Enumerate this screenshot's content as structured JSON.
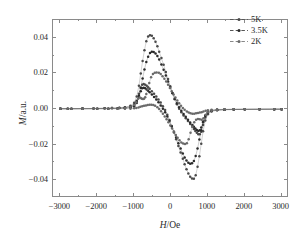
{
  "figure": {
    "background_color": "#ffffff",
    "frame_color": "#8a8a8a",
    "axis_title_x": "H/Oe",
    "axis_title_x_italic_part": "H",
    "axis_title_x_rest": "/Oe",
    "axis_title_y": "M/a.u.",
    "axis_title_y_italic_part": "M",
    "axis_title_y_rest": "/a.u."
  },
  "legend": {
    "position": "top-right",
    "entries": [
      {
        "label": "5K",
        "color": "#4a4a4a",
        "marker": "dot"
      },
      {
        "label": "3.5K",
        "color": "#2a2a2a",
        "marker": "dot"
      },
      {
        "label": "2K",
        "color": "#6a6a6a",
        "marker": "dot"
      }
    ]
  },
  "axes": {
    "x_ticks": [
      -3000,
      -2000,
      -1000,
      0,
      1000,
      2000,
      3000
    ],
    "x_tick_labels": [
      "-3000",
      "-2000",
      "-1000",
      "0",
      "1000",
      "2000",
      "3000"
    ],
    "y_ticks": [
      0.04,
      0.02,
      0.0,
      -0.02,
      -0.04
    ],
    "y_tick_labels": [
      "0.04",
      "0.02",
      "0.00",
      "-0.02",
      "-0.04"
    ],
    "xlim": [
      -3200,
      3200
    ],
    "ylim": [
      -0.05,
      0.05
    ],
    "x_minor_per_major": 2,
    "y_minor_per_major": 2
  },
  "chart_data": {
    "type": "line",
    "title": "",
    "xlabel": "H/Oe",
    "ylabel": "M/a.u.",
    "xlim": [
      -3200,
      3200
    ],
    "ylim": [
      -0.05,
      0.05
    ],
    "grid": false,
    "legend_position": "top-right",
    "series": [
      {
        "name": "5K",
        "color": "#4a4a4a",
        "marker": "dot",
        "linestyle": "dashdot",
        "peak_positive": 0.0415,
        "peak_positive_at_H": -520,
        "peak_negative": -0.0392,
        "peak_negative_at_H": 620,
        "branch_descending_x": [
          -3000,
          -2700,
          -2400,
          -2100,
          -1800,
          -1600,
          -1400,
          -1250,
          -1100,
          -1000,
          -930,
          -870,
          -820,
          -770,
          -720,
          -670,
          -620,
          -570,
          -520,
          -470,
          -420,
          -370,
          -320,
          -260,
          -200,
          -140,
          -80,
          -20,
          40,
          100,
          160,
          220,
          280,
          340,
          400,
          460,
          520,
          580,
          620,
          660,
          700,
          740,
          780,
          820,
          870,
          930,
          1000,
          1100,
          1250,
          1450,
          1700,
          2000,
          2400,
          2800,
          3000
        ],
        "branch_descending_y": [
          0.0002,
          0.0002,
          0.0003,
          0.0003,
          0.0004,
          0.0005,
          0.0007,
          0.001,
          0.0018,
          0.0035,
          0.007,
          0.013,
          0.02,
          0.027,
          0.033,
          0.038,
          0.0408,
          0.0415,
          0.0412,
          0.0398,
          0.0378,
          0.0352,
          0.0322,
          0.0286,
          0.0248,
          0.0208,
          0.0168,
          0.0128,
          0.009,
          0.0055,
          0.0026,
          0.0002,
          -0.0018,
          -0.0036,
          -0.0052,
          -0.0068,
          -0.0084,
          -0.01,
          -0.0112,
          -0.0124,
          -0.0134,
          -0.0142,
          -0.0142,
          -0.0128,
          -0.009,
          -0.0048,
          -0.0022,
          -0.001,
          -0.0005,
          -0.0003,
          -0.0002,
          -0.0002,
          -0.0001,
          -0.0001,
          -0.0001
        ],
        "branch_ascending_x": [
          3000,
          2800,
          2400,
          2000,
          1700,
          1450,
          1250,
          1100,
          1000,
          930,
          870,
          820,
          770,
          720,
          670,
          620,
          570,
          520,
          470,
          420,
          370,
          320,
          260,
          200,
          140,
          80,
          20,
          -40,
          -100,
          -160,
          -220,
          -280,
          -340,
          -400,
          -460,
          -520,
          -580,
          -620,
          -660,
          -700,
          -740,
          -780,
          -820,
          -870,
          -930,
          -1000,
          -1100,
          -1250,
          -1450,
          -1700,
          -2000,
          -2400,
          -2800,
          -3000
        ],
        "branch_ascending_y": [
          -0.0001,
          -0.0001,
          -0.0002,
          -0.0002,
          -0.0003,
          -0.0004,
          -0.0007,
          -0.0014,
          -0.003,
          -0.0065,
          -0.0125,
          -0.0195,
          -0.0265,
          -0.0325,
          -0.0372,
          -0.0392,
          -0.039,
          -0.038,
          -0.0362,
          -0.0338,
          -0.031,
          -0.028,
          -0.0244,
          -0.0208,
          -0.017,
          -0.0132,
          -0.0096,
          -0.0062,
          -0.0032,
          -0.0006,
          0.0016,
          0.0036,
          0.0054,
          0.007,
          0.0086,
          0.01,
          0.0114,
          0.0122,
          0.013,
          0.0136,
          0.014,
          0.0136,
          0.012,
          0.0086,
          0.0046,
          0.0022,
          0.001,
          0.0005,
          0.0003,
          0.0002,
          0.0002,
          0.0001,
          0.0001,
          0.0001
        ]
      },
      {
        "name": "3.5K",
        "color": "#2a2a2a",
        "marker": "dot",
        "linestyle": "dashdot",
        "peak_positive": 0.0322,
        "peak_positive_at_H": -420,
        "peak_negative": -0.0307,
        "peak_negative_at_H": 520,
        "branch_descending_x": [
          -3000,
          -2700,
          -2400,
          -2100,
          -1800,
          -1600,
          -1400,
          -1250,
          -1100,
          -1000,
          -930,
          -870,
          -820,
          -770,
          -720,
          -670,
          -620,
          -570,
          -520,
          -470,
          -420,
          -370,
          -320,
          -260,
          -200,
          -140,
          -80,
          -20,
          40,
          100,
          160,
          220,
          280,
          340,
          400,
          460,
          520,
          580,
          620,
          660,
          700,
          740,
          780,
          820,
          870,
          930,
          1000,
          1100,
          1250,
          1450,
          1700,
          2000,
          2400,
          2800,
          3000
        ],
        "branch_descending_y": [
          0.0002,
          0.0002,
          0.0003,
          0.0003,
          0.0004,
          0.0005,
          0.0006,
          0.0009,
          0.0014,
          0.0024,
          0.0042,
          0.0075,
          0.012,
          0.0172,
          0.0222,
          0.0264,
          0.0294,
          0.0314,
          0.0322,
          0.032,
          0.0312,
          0.0298,
          0.0278,
          0.025,
          0.022,
          0.0188,
          0.0154,
          0.012,
          0.0088,
          0.0058,
          0.0032,
          0.001,
          -0.001,
          -0.0028,
          -0.0044,
          -0.006,
          -0.0076,
          -0.009,
          -0.01,
          -0.011,
          -0.0118,
          -0.0124,
          -0.012,
          -0.0104,
          -0.007,
          -0.0036,
          -0.0016,
          -0.0008,
          -0.0004,
          -0.0003,
          -0.0002,
          -0.0002,
          -0.0001,
          -0.0001,
          -0.0001
        ],
        "branch_ascending_x": [
          3000,
          2800,
          2400,
          2000,
          1700,
          1450,
          1250,
          1100,
          1000,
          930,
          870,
          820,
          770,
          720,
          670,
          620,
          570,
          520,
          470,
          420,
          370,
          320,
          260,
          200,
          140,
          80,
          20,
          -40,
          -100,
          -160,
          -220,
          -280,
          -340,
          -400,
          -460,
          -520,
          -580,
          -620,
          -660,
          -700,
          -740,
          -780,
          -820,
          -870,
          -930,
          -1000,
          -1100,
          -1250,
          -1450,
          -1700,
          -2000,
          -2400,
          -2800,
          -3000
        ],
        "branch_ascending_y": [
          -0.0001,
          -0.0001,
          -0.0002,
          -0.0002,
          -0.0003,
          -0.0004,
          -0.0006,
          -0.0011,
          -0.0022,
          -0.004,
          -0.0074,
          -0.012,
          -0.0172,
          -0.0222,
          -0.0264,
          -0.0292,
          -0.0305,
          -0.0307,
          -0.0302,
          -0.029,
          -0.0272,
          -0.025,
          -0.0222,
          -0.0192,
          -0.016,
          -0.0128,
          -0.0098,
          -0.0068,
          -0.0042,
          -0.0018,
          0.0002,
          0.002,
          0.0038,
          0.0054,
          0.0068,
          0.0082,
          0.0094,
          0.0102,
          0.011,
          0.0116,
          0.012,
          0.0116,
          0.01,
          0.0068,
          0.0034,
          0.0015,
          0.0007,
          0.0004,
          0.0003,
          0.0002,
          0.0002,
          0.0001,
          0.0001,
          0.0001
        ]
      },
      {
        "name": "2K",
        "color": "#6a6a6a",
        "marker": "dot",
        "linestyle": "dashdot",
        "peak_positive": 0.0205,
        "peak_positive_at_H": -330,
        "peak_negative": -0.0196,
        "peak_negative_at_H": 430,
        "branch_descending_x": [
          -3000,
          -2700,
          -2400,
          -2100,
          -1800,
          -1600,
          -1400,
          -1250,
          -1100,
          -1000,
          -940,
          -890,
          -850,
          -820,
          -790,
          -760,
          -730,
          -700,
          -670,
          -630,
          -590,
          -540,
          -490,
          -440,
          -390,
          -330,
          -280,
          -230,
          -180,
          -130,
          -80,
          -30,
          20,
          70,
          120,
          170,
          220,
          270,
          320,
          370,
          430,
          480,
          530,
          580,
          630,
          680,
          730,
          780,
          830,
          880,
          940,
          1000,
          1100,
          1250,
          1450,
          1700,
          2000,
          2400,
          2800,
          3000
        ],
        "branch_descending_y": [
          0.0002,
          0.0002,
          0.0002,
          0.0003,
          0.0003,
          0.0004,
          0.0005,
          0.0007,
          0.0012,
          0.0022,
          0.0038,
          0.0058,
          0.0065,
          0.0062,
          0.0058,
          0.0056,
          0.0058,
          0.0066,
          0.0084,
          0.0112,
          0.0146,
          0.0178,
          0.0196,
          0.0204,
          0.0205,
          0.0203,
          0.0196,
          0.0184,
          0.017,
          0.0154,
          0.0136,
          0.0118,
          0.01,
          0.0082,
          0.0064,
          0.0048,
          0.0032,
          0.0018,
          0.0006,
          -0.0004,
          -0.0014,
          -0.002,
          -0.0024,
          -0.0026,
          -0.0026,
          -0.0024,
          -0.0022,
          -0.002,
          -0.0018,
          -0.0014,
          -0.001,
          -0.0007,
          -0.0004,
          -0.0002,
          -0.0002,
          -0.0001,
          -0.0001,
          -0.0001,
          -0.0001,
          -0.0001
        ],
        "branch_ascending_x": [
          3000,
          2800,
          2400,
          2000,
          1700,
          1450,
          1250,
          1100,
          1000,
          940,
          880,
          830,
          780,
          730,
          680,
          630,
          580,
          530,
          480,
          430,
          380,
          330,
          280,
          230,
          180,
          130,
          80,
          30,
          -20,
          -70,
          -120,
          -170,
          -220,
          -270,
          -320,
          -370,
          -430,
          -480,
          -530,
          -580,
          -630,
          -680,
          -730,
          -780,
          -830,
          -880,
          -940,
          -1000,
          -1100,
          -1250,
          -1450,
          -1700,
          -2000,
          -2400,
          -2800,
          -3000
        ],
        "branch_ascending_y": [
          -0.0001,
          -0.0001,
          -0.0001,
          -0.0002,
          -0.0002,
          -0.0003,
          -0.0005,
          -0.001,
          -0.0018,
          -0.0032,
          -0.0052,
          -0.006,
          -0.0058,
          -0.0056,
          -0.006,
          -0.0074,
          -0.01,
          -0.0134,
          -0.017,
          -0.0192,
          -0.0196,
          -0.0194,
          -0.0188,
          -0.0176,
          -0.0162,
          -0.0146,
          -0.0128,
          -0.011,
          -0.0092,
          -0.0074,
          -0.0058,
          -0.0042,
          -0.0026,
          -0.0012,
          0.0,
          0.001,
          0.0018,
          0.0022,
          0.0024,
          0.0024,
          0.0022,
          0.002,
          0.0018,
          0.0016,
          0.0012,
          0.0009,
          0.0006,
          0.0004,
          0.0002,
          0.0002,
          0.0001,
          0.0001,
          0.0001,
          0.0001,
          0.0001,
          0.0001
        ]
      }
    ]
  }
}
